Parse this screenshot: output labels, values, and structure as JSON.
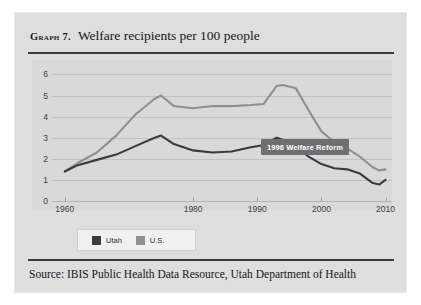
{
  "figure": {
    "graph_label": "Graph 7.",
    "title": "Welfare recipients per 100 people",
    "source": "Source: IBIS Public Health Data Resource, Utah Department of Health",
    "panel_color": "#dedede",
    "plot_color": "#d9d9d9"
  },
  "legend": {
    "items": [
      {
        "label": "Utah",
        "color": "#3a3a3f"
      },
      {
        "label": "U.S.",
        "color": "#8f8f94"
      }
    ]
  },
  "annotation": {
    "text": "1996 Welfare Reform",
    "background": "#6e6e73",
    "text_color": "#ffffff"
  },
  "chart_data": {
    "type": "line",
    "title": "Welfare recipients per 100 people",
    "xlabel": "",
    "ylabel": "",
    "xlim": [
      1958,
      2011
    ],
    "ylim": [
      0,
      6.4
    ],
    "yticks": [
      0,
      1,
      2,
      3,
      4,
      5,
      6
    ],
    "xticks": [
      1960,
      1980,
      1990,
      2000,
      2010
    ],
    "xtick_labels": [
      "1960",
      "1980",
      "1990",
      "2000",
      "2010"
    ],
    "grid": "horizontal",
    "legend_position": "bottom-left",
    "annotations": [
      {
        "text": "1996 Welfare Reform",
        "x": 1996,
        "y": 5.2
      }
    ],
    "series": [
      {
        "name": "Utah",
        "color": "#3a3a3f",
        "x": [
          1960,
          1962,
          1965,
          1968,
          1971,
          1974,
          1975,
          1977,
          1980,
          1983,
          1986,
          1989,
          1991,
          1993,
          1994,
          1996,
          1998,
          2000,
          2002,
          2004,
          2006,
          2008,
          2009,
          2010
        ],
        "values": [
          1.4,
          1.7,
          1.95,
          2.2,
          2.6,
          3.0,
          3.1,
          2.7,
          2.4,
          2.3,
          2.35,
          2.55,
          2.65,
          3.0,
          2.9,
          2.6,
          2.1,
          1.75,
          1.55,
          1.5,
          1.3,
          0.85,
          0.78,
          1.0
        ]
      },
      {
        "name": "U.S.",
        "color": "#8f8f94",
        "x": [
          1960,
          1962,
          1965,
          1968,
          1971,
          1974,
          1975,
          1977,
          1980,
          1983,
          1986,
          1989,
          1991,
          1993,
          1994,
          1996,
          1998,
          2000,
          2002,
          2004,
          2006,
          2008,
          2009,
          2010
        ],
        "values": [
          1.4,
          1.8,
          2.3,
          3.1,
          4.1,
          4.85,
          5.0,
          4.5,
          4.4,
          4.5,
          4.5,
          4.55,
          4.6,
          5.45,
          5.5,
          5.35,
          4.3,
          3.3,
          2.8,
          2.5,
          2.1,
          1.6,
          1.45,
          1.5
        ]
      }
    ]
  }
}
